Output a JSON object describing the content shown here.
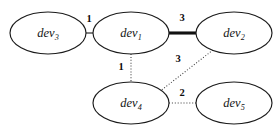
{
  "diagram": {
    "type": "undirected-weighted-graph",
    "title": "",
    "nodes": [
      {
        "id": "dev3",
        "base": "dev",
        "subscript": "3",
        "cx": 48,
        "cy": 33,
        "rx": 38,
        "ry": 21
      },
      {
        "id": "dev1",
        "base": "dev",
        "subscript": "1",
        "cx": 131,
        "cy": 33,
        "rx": 38,
        "ry": 21
      },
      {
        "id": "dev2",
        "base": "dev",
        "subscript": "2",
        "cx": 234,
        "cy": 33,
        "rx": 38,
        "ry": 21
      },
      {
        "id": "dev4",
        "base": "dev",
        "subscript": "4",
        "cx": 131,
        "cy": 103,
        "rx": 38,
        "ry": 21
      },
      {
        "id": "dev5",
        "base": "dev",
        "subscript": "5",
        "cx": 234,
        "cy": 103,
        "rx": 38,
        "ry": 21
      }
    ],
    "edges": [
      {
        "id": "edge-dev3-dev1",
        "from": "dev3",
        "to": "dev1",
        "weight": "1",
        "style": "solid-thin",
        "x1": 86,
        "y1": 33,
        "x2": 93,
        "y2": 33,
        "label_x": 89,
        "label_y": 20
      },
      {
        "id": "edge-dev1-dev2",
        "from": "dev1",
        "to": "dev2",
        "weight": "3",
        "style": "solid-thick",
        "x1": 169,
        "y1": 33,
        "x2": 196,
        "y2": 33,
        "label_x": 182,
        "label_y": 19
      },
      {
        "id": "edge-dev1-dev4",
        "from": "dev1",
        "to": "dev4",
        "weight": "1",
        "style": "dotted",
        "x1": 131,
        "y1": 54,
        "x2": 131,
        "y2": 82,
        "label_x": 121,
        "label_y": 68
      },
      {
        "id": "edge-dev2-dev4",
        "from": "dev2",
        "to": "dev4",
        "weight": "3",
        "style": "dotted",
        "x1": 213,
        "y1": 50,
        "x2": 159,
        "y2": 92,
        "label_x": 178,
        "label_y": 60
      },
      {
        "id": "edge-dev4-dev5",
        "from": "dev4",
        "to": "dev5",
        "weight": "2",
        "style": "dotted",
        "x1": 169,
        "y1": 103,
        "x2": 196,
        "y2": 103,
        "label_x": 182,
        "label_y": 94
      }
    ]
  }
}
